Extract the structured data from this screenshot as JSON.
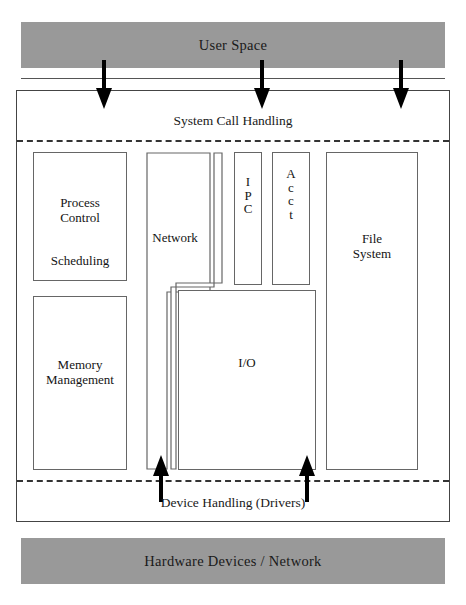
{
  "diagram": {
    "bands": {
      "user_space": "User Space",
      "hardware": "Hardware Devices / Network"
    },
    "layers": {
      "system_call": "System Call Handling",
      "device_handling": "Device Handling (Drivers)"
    },
    "blocks": {
      "process_control": "Process\nControl",
      "scheduling": "Scheduling",
      "memory_management": "Memory\nManagement",
      "network": "Network",
      "ipc_letters": [
        "I",
        "P",
        "C"
      ],
      "acct_letters": [
        "A",
        "c",
        "c",
        "t"
      ],
      "io": "I/O",
      "file_system": "File\nSystem"
    },
    "arrows": {
      "down": [
        "syscall-arrow-left",
        "syscall-arrow-center",
        "syscall-arrow-right"
      ],
      "up": [
        "driver-arrow-network",
        "driver-arrow-io"
      ]
    },
    "colors": {
      "band_fill": "#999999",
      "stroke": "#666666",
      "outer_stroke": "#444444",
      "arrow_fill": "#000000",
      "background": "#ffffff"
    }
  }
}
